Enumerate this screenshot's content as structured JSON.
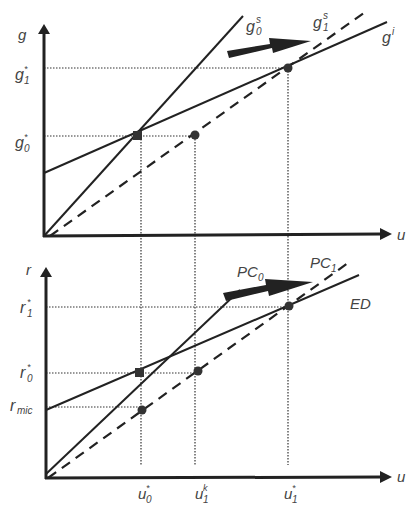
{
  "top_panel": {
    "y_axis_label": "g",
    "x_axis_label": "u",
    "y_ticks": {
      "g1_star": "g",
      "g1_star_sub": "1",
      "g0_star": "g",
      "g0_star_sub": "0"
    },
    "curves": {
      "g0s": {
        "base": "g",
        "sup": "s",
        "sub": "0"
      },
      "g1s": {
        "base": "g",
        "sup": "s",
        "sub": "1"
      },
      "gi": {
        "base": "g",
        "sup": "i"
      }
    }
  },
  "bottom_panel": {
    "y_axis_label": "r",
    "x_axis_label": "u",
    "y_ticks": {
      "r1_star": "r",
      "r1_star_sub": "1",
      "r0_star": "r",
      "r0_star_sub": "0",
      "rmic": "r",
      "rmic_sub": "mic"
    },
    "curves": {
      "pc0": {
        "base": "PC",
        "sub": "0"
      },
      "pc1": {
        "base": "PC",
        "sub": "1"
      },
      "ed": {
        "base": "ED"
      }
    },
    "x_ticks": {
      "u0_star": {
        "base": "u",
        "sup": "*",
        "sub": "0"
      },
      "u1_k": {
        "base": "u",
        "sup": "k",
        "sub": "1"
      },
      "u1_star": {
        "base": "u",
        "sup": "*",
        "sub": "1"
      }
    }
  },
  "star": "*"
}
